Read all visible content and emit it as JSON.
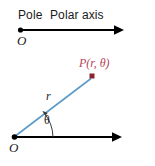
{
  "figure": {
    "background_color": "#ffffff"
  },
  "top_diagram": {
    "pole_label": "Pole",
    "polar_axis_label": "Polar axis",
    "origin_label": "O",
    "axis_color": "#000000",
    "axis_start_x": 20,
    "axis_end_x": 122,
    "axis_y": 30
  },
  "bottom_diagram": {
    "origin_label": "O",
    "radius_label": "r",
    "angle_label": "θ",
    "point_label": "P(r, θ)",
    "ray_color": "#5b9bc9",
    "point_color": "#8c2430",
    "point_label_color": "#b5435a",
    "axis_color": "#000000",
    "origin_x": 14,
    "origin_y": 137,
    "point_x": 92,
    "point_y": 78,
    "axis_end_x": 122
  },
  "caption": {
    "text": ""
  }
}
